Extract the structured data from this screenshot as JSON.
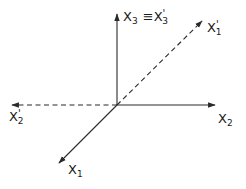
{
  "diagram": {
    "type": "coordinate-axes-rotation",
    "origin": {
      "x": 117,
      "y": 105
    },
    "axes": [
      {
        "id": "x1",
        "style": "solid",
        "from": [
          117,
          105
        ],
        "to": [
          58,
          164
        ],
        "label": "X",
        "subscript": "1",
        "prime": ""
      },
      {
        "id": "x2",
        "style": "solid",
        "from": [
          117,
          105
        ],
        "to": [
          216,
          105
        ],
        "label": "X",
        "subscript": "2",
        "prime": ""
      },
      {
        "id": "x3",
        "style": "solid",
        "from": [
          117,
          105
        ],
        "to": [
          117,
          13
        ],
        "label": "X",
        "subscript": "3",
        "prime": ""
      },
      {
        "id": "x1p",
        "style": "dashed",
        "from": [
          117,
          105
        ],
        "to": [
          203,
          20
        ],
        "label": "X",
        "subscript": "1",
        "prime": "'"
      },
      {
        "id": "x2p",
        "style": "dashed",
        "from": [
          117,
          105
        ],
        "to": [
          11,
          105
        ],
        "label": "X",
        "subscript": "2",
        "prime": "'"
      }
    ],
    "labels": {
      "x3": {
        "main": "X",
        "sub": "3",
        "equiv": "≡",
        "main2": "X",
        "prime2": "'",
        "sub2": "3"
      },
      "x1p": {
        "main": "X",
        "prime": "'",
        "sub": "1"
      },
      "x2p": {
        "main": "X",
        "prime": "'",
        "sub": "2"
      },
      "x2": {
        "main": "X",
        "sub": "2"
      },
      "x1": {
        "main": "X",
        "sub": "1"
      }
    },
    "colors": {
      "line": "#2a2a2a",
      "background": "#ffffff"
    }
  }
}
